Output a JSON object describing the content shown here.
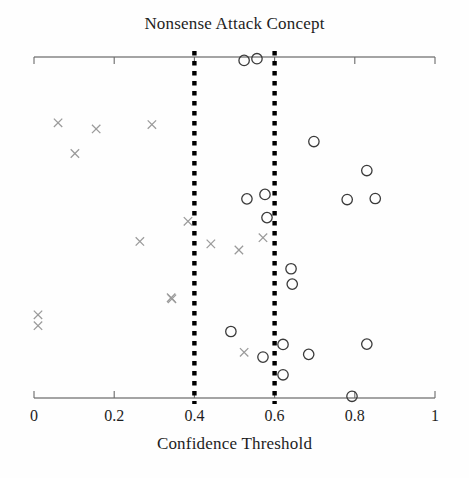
{
  "chart_data": {
    "type": "scatter",
    "title": "Nonsense Attack Concept",
    "xlabel": "Confidence Threshold",
    "ylabel": "",
    "xlim": [
      0,
      1
    ],
    "ylim": [
      0,
      1
    ],
    "grid": false,
    "legend": "none",
    "xticks": [
      0,
      0.2,
      0.4,
      0.6,
      0.8,
      1
    ],
    "xtick_labels": [
      "0",
      "0.2",
      "0.4",
      "0.6",
      "0.8",
      "1"
    ],
    "annotations": [
      {
        "name": "threshold-line-low",
        "type": "vline",
        "x": 0.4,
        "style": "dotted",
        "color": "#000000"
      },
      {
        "name": "threshold-line-high",
        "type": "vline",
        "x": 0.6,
        "style": "dotted",
        "color": "#000000"
      }
    ],
    "series": [
      {
        "name": "circle-markers",
        "marker": "circle",
        "color": "#3a3a3a",
        "points": [
          {
            "x": 0.524,
            "y": 0.99
          },
          {
            "x": 0.556,
            "y": 0.995
          },
          {
            "x": 0.698,
            "y": 0.752
          },
          {
            "x": 0.83,
            "y": 0.667
          },
          {
            "x": 0.576,
            "y": 0.597
          },
          {
            "x": 0.531,
            "y": 0.584
          },
          {
            "x": 0.781,
            "y": 0.582
          },
          {
            "x": 0.851,
            "y": 0.585
          },
          {
            "x": 0.581,
            "y": 0.529
          },
          {
            "x": 0.641,
            "y": 0.379
          },
          {
            "x": 0.644,
            "y": 0.334
          },
          {
            "x": 0.491,
            "y": 0.195
          },
          {
            "x": 0.621,
            "y": 0.157
          },
          {
            "x": 0.571,
            "y": 0.12
          },
          {
            "x": 0.685,
            "y": 0.128
          },
          {
            "x": 0.83,
            "y": 0.158
          },
          {
            "x": 0.621,
            "y": 0.068
          },
          {
            "x": 0.793,
            "y": 0.005
          }
        ]
      },
      {
        "name": "cross-markers",
        "marker": "x",
        "color": "#9a9a9a",
        "points": [
          {
            "x": 0.06,
            "y": 0.807
          },
          {
            "x": 0.155,
            "y": 0.789
          },
          {
            "x": 0.294,
            "y": 0.802
          },
          {
            "x": 0.102,
            "y": 0.717
          },
          {
            "x": 0.384,
            "y": 0.518
          },
          {
            "x": 0.264,
            "y": 0.459
          },
          {
            "x": 0.441,
            "y": 0.452
          },
          {
            "x": 0.511,
            "y": 0.434
          },
          {
            "x": 0.571,
            "y": 0.47
          },
          {
            "x": 0.342,
            "y": 0.294
          },
          {
            "x": 0.344,
            "y": 0.291
          },
          {
            "x": 0.524,
            "y": 0.134
          },
          {
            "x": 0.01,
            "y": 0.244
          },
          {
            "x": 0.01,
            "y": 0.212
          }
        ]
      }
    ]
  },
  "axes": {
    "x_pixel_left": 34,
    "x_pixel_right": 435,
    "y_pixel_top": 57,
    "y_pixel_bottom": 398
  }
}
